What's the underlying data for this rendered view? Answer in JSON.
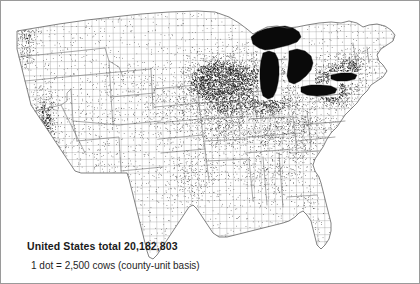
{
  "figure": {
    "kind": "dot-density-map",
    "title_visible": false,
    "background_color": "#ffffff",
    "frame_color": "#9a9a9a",
    "width": 420,
    "height": 284
  },
  "caption": {
    "total_line": "United States total 20,182,803",
    "legend_line": "1 dot = 2,500 cows (county-unit basis)"
  },
  "chart_data": {
    "type": "scatter",
    "subtype": "dot-density-choropleth",
    "title": "United States total 20,182,803",
    "xlabel": "",
    "ylabel": "",
    "legend": "1 dot = 2,500 cows (county-unit basis)",
    "dot_value": 2500,
    "dot_unit": "cows",
    "aggregation": "county-unit basis",
    "national_total": 20182803,
    "implied_dot_count": 8073,
    "region_extent": "contiguous United States",
    "dot_color": "#141414",
    "lake_color": "#0a0a0a",
    "boundary_color": "#6e6e6e",
    "density_scale": [
      {
        "label": "very high",
        "weight": 1.0
      },
      {
        "label": "high",
        "weight": 0.62
      },
      {
        "label": "moderate",
        "weight": 0.33
      },
      {
        "label": "low",
        "weight": 0.14
      },
      {
        "label": "very low",
        "weight": 0.04
      }
    ],
    "regions": [
      {
        "name": "Wisconsin dairy belt",
        "density": "very high",
        "weight": 1.0
      },
      {
        "name": "Minnesota southeast",
        "density": "very high",
        "weight": 0.92
      },
      {
        "name": "Michigan lower peninsula",
        "density": "high",
        "weight": 0.6
      },
      {
        "name": "Upstate New York",
        "density": "high",
        "weight": 0.66
      },
      {
        "name": "Pennsylvania",
        "density": "high",
        "weight": 0.64
      },
      {
        "name": "Ohio and Indiana",
        "density": "moderate",
        "weight": 0.45
      },
      {
        "name": "Iowa and Illinois",
        "density": "moderate",
        "weight": 0.44
      },
      {
        "name": "California Central Valley",
        "density": "high",
        "weight": 0.72
      },
      {
        "name": "California south coast",
        "density": "high",
        "weight": 0.58
      },
      {
        "name": "Puget Sound and Willamette",
        "density": "high",
        "weight": 0.55
      },
      {
        "name": "Kentucky and Tennessee",
        "density": "moderate",
        "weight": 0.38
      },
      {
        "name": "Missouri",
        "density": "moderate",
        "weight": 0.36
      },
      {
        "name": "Southeast coastal plain",
        "density": "low",
        "weight": 0.18
      },
      {
        "name": "Texas",
        "density": "low",
        "weight": 0.16
      },
      {
        "name": "Great Plains",
        "density": "low",
        "weight": 0.15
      },
      {
        "name": "Florida peninsula",
        "density": "low",
        "weight": 0.1
      },
      {
        "name": "Mountain West interior",
        "density": "very low",
        "weight": 0.045
      },
      {
        "name": "Nevada and Utah desert",
        "density": "very low",
        "weight": 0.02
      },
      {
        "name": "Arizona and New Mexico",
        "density": "very low",
        "weight": 0.035
      }
    ],
    "lakes": [
      "Lake Superior",
      "Lake Michigan",
      "Lake Huron",
      "Lake Erie",
      "Lake Ontario"
    ]
  }
}
